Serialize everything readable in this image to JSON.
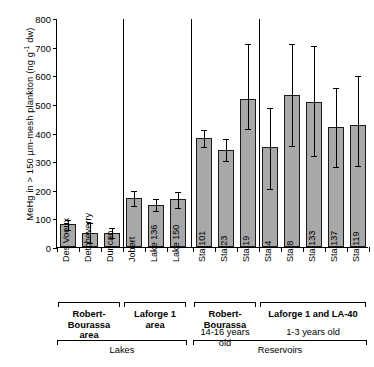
{
  "chart_data": {
    "type": "bar",
    "title": "",
    "xlabel": "",
    "ylabel_parts": {
      "pre": "MeHg in > 150 µm-mesh plankton (ng g",
      "sup": "-1",
      "post": " dw)"
    },
    "ylabel": "MeHg in > 150 µm-mesh plankton (ng g-1 dw)",
    "ylim": [
      0,
      800
    ],
    "yticks": [
      0,
      100,
      200,
      300,
      400,
      500,
      600,
      700,
      800
    ],
    "ytick_labels": [
      "0",
      "100",
      "200",
      "300",
      "400",
      "500",
      "600",
      "700",
      "800"
    ],
    "grid": false,
    "legend": "none",
    "categories": [
      "Des Voeux",
      "Detcheverry",
      "Duncan",
      "Jobert",
      "Lake 136",
      "Lake 150",
      "Sta 101",
      "Sta 23",
      "Sta 19",
      "Sta 4",
      "Sta 8",
      "Sta 133",
      "Sta 137",
      "Sta 119"
    ],
    "values": [
      80,
      48,
      50,
      172,
      148,
      167,
      382,
      340,
      518,
      348,
      530,
      508,
      420,
      425
    ],
    "err_low": [
      62,
      18,
      35,
      148,
      128,
      140,
      352,
      305,
      415,
      205,
      358,
      320,
      282,
      288
    ],
    "err_high": [
      97,
      88,
      70,
      200,
      170,
      196,
      412,
      382,
      712,
      490,
      712,
      705,
      558,
      600
    ],
    "bar_fill": "#a8a8a8",
    "bar_edge": "#1a1a1a",
    "axis_color": "#000000"
  },
  "groups_upper": [
    {
      "label_lines": [
        "Robert-",
        "Bourassa",
        "area"
      ],
      "bold": true,
      "from": 0,
      "to": 2,
      "age": ""
    },
    {
      "label_lines": [
        "Laforge 1",
        "area"
      ],
      "bold": true,
      "from": 3,
      "to": 5,
      "age": ""
    },
    {
      "label_lines": [
        "Robert-",
        "Bourassa"
      ],
      "bold": true,
      "from": 6,
      "to": 8,
      "age": "14-16 years old"
    },
    {
      "label_lines": [
        "Laforge 1 and LA-40"
      ],
      "bold": true,
      "from": 9,
      "to": 13,
      "age": "1-3 years old"
    }
  ],
  "groups_lower": [
    {
      "label": "Lakes",
      "from": 0,
      "to": 5
    },
    {
      "label": "Reservoirs",
      "from": 6,
      "to": 13
    }
  ]
}
